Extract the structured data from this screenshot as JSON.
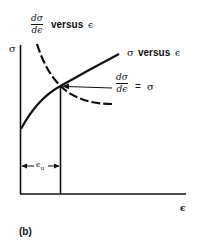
{
  "figure": {
    "panel_label": "(b)",
    "y_axis_label": "σ",
    "x_axis_label": "ϵ",
    "curves": {
      "stress_strain": {
        "label_symbol": "σ",
        "label_word": "versus",
        "label_var": "ϵ"
      },
      "derivative": {
        "numerator": "dσ",
        "denominator": "dϵ",
        "label_word": "versus",
        "label_var": "ϵ"
      }
    },
    "intersection": {
      "numerator": "dσ",
      "denominator": "dϵ",
      "equals": "=",
      "rhs": "σ"
    },
    "uniform_strain": {
      "label": "ϵ",
      "subscript": "u"
    }
  }
}
